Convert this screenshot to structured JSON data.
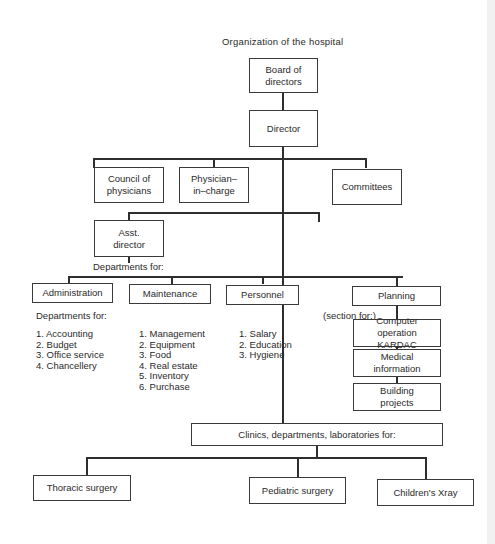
{
  "diagram": {
    "title": "Organization of the hospital",
    "nodes": {
      "board": "Board of directors",
      "director": "Director",
      "council": "Council of physicians",
      "physician": "Physician–in–charge",
      "committees": "Committees",
      "asst_director": "Asst. director",
      "departments_for_label": "Departments for:",
      "administration": "Administration",
      "maintenance": "Maintenance",
      "personnel": "Personnel",
      "planning": "Planning",
      "section_for_label": "(section for:)",
      "computer": "Computer operation KARDAC",
      "medical": "Medical information",
      "building": "Building projects",
      "clinics": "Clinics, departments, laboratories for:",
      "thoracic": "Thoracic surgery",
      "pediatric": "Pediatric surgery",
      "xray": "Children's Xray"
    },
    "administration_sub_label": "Departments for:",
    "administration_items": [
      "1. Accounting",
      "2. Budget",
      "3. Office service",
      "4. Chancellery"
    ],
    "maintenance_items": [
      "1. Management",
      "2. Equipment",
      "3. Food",
      "4. Real estate",
      "5. Inventory",
      "6. Purchase"
    ],
    "personnel_items": [
      "1. Salary",
      "2. Education",
      "3. Hygiene"
    ]
  }
}
